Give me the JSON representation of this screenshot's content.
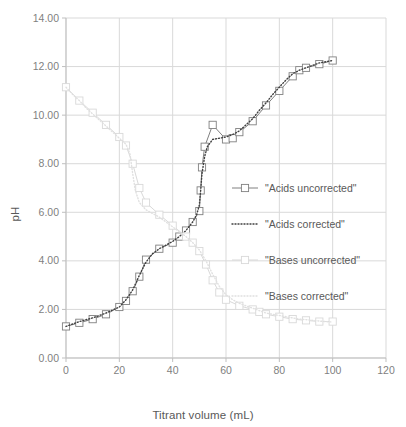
{
  "chart_data": {
    "type": "line",
    "title": "",
    "xlabel": "Titrant volume (mL)",
    "ylabel": "pH",
    "xlim": [
      0,
      120
    ],
    "ylim": [
      0,
      14
    ],
    "xticks": [
      0,
      20,
      40,
      60,
      80,
      100,
      120
    ],
    "xtick_labels": [
      "0",
      "20",
      "40",
      "60",
      "80",
      "100",
      "120"
    ],
    "yticks": [
      0,
      2,
      4,
      6,
      8,
      10,
      12,
      14
    ],
    "ytick_labels": [
      "0.00",
      "2.00",
      "4.00",
      "6.00",
      "8.00",
      "10.00",
      "12.00",
      "14.00"
    ],
    "grid": true,
    "legend_position": "right-inside",
    "series": [
      {
        "name": "\"Acids uncorrected\"",
        "style": "line-with-open-square-markers",
        "color": "#808080",
        "marker": "open-square",
        "x": [
          0,
          5,
          10,
          15,
          20,
          22.5,
          25,
          27.5,
          30,
          35,
          40,
          42.5,
          45,
          47.5,
          50,
          50.5,
          51,
          52,
          55,
          60,
          62.5,
          65,
          70,
          75,
          80,
          85,
          87.5,
          90,
          95,
          100
        ],
        "y": [
          1.3,
          1.45,
          1.6,
          1.8,
          2.1,
          2.35,
          2.75,
          3.35,
          4.05,
          4.5,
          4.75,
          5.0,
          5.25,
          5.6,
          6.05,
          6.9,
          7.85,
          8.7,
          9.6,
          9.0,
          9.05,
          9.3,
          9.75,
          10.4,
          11.0,
          11.6,
          11.85,
          11.95,
          12.1,
          12.25
        ]
      },
      {
        "name": "\"Acids corrected\"",
        "style": "dotted",
        "color": "#404040",
        "marker": "none",
        "x": [
          0,
          5,
          10,
          15,
          20,
          22.5,
          25,
          27.5,
          30,
          32.5,
          35,
          37.5,
          40,
          42.5,
          45,
          47.5,
          49,
          50,
          50.5,
          51,
          52,
          53,
          55,
          57.5,
          60,
          62.5,
          65,
          67.5,
          70,
          72.5,
          75,
          77.5,
          80,
          82.5,
          85,
          87.5,
          90,
          92.5,
          95,
          97.5,
          100
        ],
        "y": [
          1.3,
          1.5,
          1.65,
          1.85,
          2.1,
          2.4,
          2.8,
          3.4,
          3.95,
          4.3,
          4.5,
          4.65,
          4.8,
          5.0,
          5.25,
          5.6,
          5.9,
          6.3,
          6.9,
          7.6,
          8.3,
          8.7,
          9.0,
          9.05,
          9.1,
          9.2,
          9.35,
          9.6,
          9.85,
          10.2,
          10.5,
          10.85,
          11.15,
          11.45,
          11.7,
          11.85,
          11.95,
          12.05,
          12.15,
          12.2,
          12.25
        ]
      },
      {
        "name": "\"Bases uncorrected\"",
        "style": "line-with-open-square-markers",
        "color": "#d9d9d9",
        "marker": "open-square",
        "x": [
          0,
          5,
          10,
          15,
          20,
          22.5,
          25,
          27.5,
          30,
          35,
          40,
          45,
          47.5,
          50,
          52.5,
          55,
          57.5,
          60,
          65,
          70,
          72.5,
          75,
          80,
          85,
          90,
          95,
          100
        ],
        "y": [
          11.15,
          10.6,
          10.1,
          9.6,
          9.1,
          8.75,
          8.0,
          7.0,
          6.4,
          5.9,
          5.45,
          5.0,
          4.75,
          4.4,
          3.85,
          3.2,
          2.7,
          2.4,
          2.15,
          2.0,
          1.9,
          1.8,
          1.7,
          1.6,
          1.55,
          1.5,
          1.5
        ]
      },
      {
        "name": "\"Bases corrected\"",
        "style": "dotted",
        "color": "#e0e0e0",
        "marker": "none",
        "x": [
          0,
          2.5,
          5,
          7.5,
          10,
          12.5,
          15,
          17.5,
          20,
          22.5,
          24,
          25,
          26,
          27.5,
          30,
          32.5,
          35,
          37.5,
          40,
          42.5,
          45,
          47.5,
          50,
          52.5,
          55,
          57.5,
          60,
          62.5,
          65,
          67.5,
          70,
          72.5,
          75,
          77.5,
          80,
          82.5,
          85,
          87.5,
          90,
          92.5,
          95,
          97.5,
          100
        ],
        "y": [
          11.15,
          10.85,
          10.6,
          10.3,
          10.05,
          9.8,
          9.55,
          9.3,
          9.05,
          8.8,
          8.4,
          7.6,
          6.9,
          6.4,
          6.1,
          5.95,
          5.8,
          5.6,
          5.4,
          5.2,
          5.0,
          4.75,
          4.45,
          4.0,
          3.45,
          2.95,
          2.6,
          2.4,
          2.25,
          2.15,
          2.05,
          1.95,
          1.85,
          1.8,
          1.75,
          1.7,
          1.65,
          1.6,
          1.58,
          1.55,
          1.52,
          1.5,
          1.48
        ]
      }
    ]
  },
  "colors": {
    "grid": "#d9d9d9",
    "axis": "#bfbfbf",
    "text": "#595959",
    "tick_text": "#7f7f7f",
    "background": "#ffffff"
  }
}
